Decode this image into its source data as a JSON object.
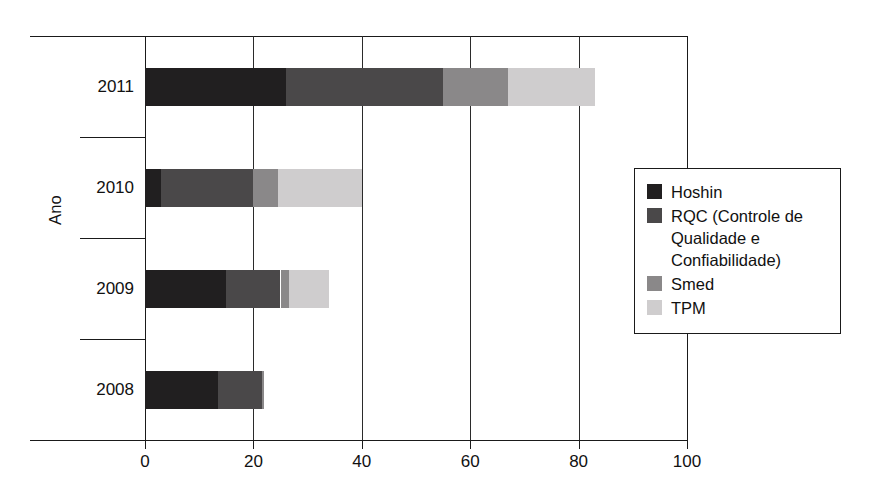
{
  "chart_data": {
    "type": "bar",
    "orientation": "horizontal",
    "stacked": true,
    "title": "",
    "xlabel": "",
    "ylabel": "Ano",
    "categories": [
      "2011",
      "2010",
      "2009",
      "2008"
    ],
    "xlim": [
      0,
      100
    ],
    "xticks": [
      0,
      20,
      40,
      60,
      80,
      100
    ],
    "xtick_labels": [
      "0",
      "20",
      "40",
      "60",
      "80",
      "100"
    ],
    "grid": "vertical",
    "legend_position": "right-middle",
    "series": [
      {
        "name": "Hoshin",
        "color": "#211f20",
        "values": [
          26,
          3,
          15,
          13.5
        ]
      },
      {
        "name": "RQC (Controle de Qualidade e Confiabilidade)",
        "color": "#4a4849",
        "values": [
          29,
          17,
          10,
          8
        ]
      },
      {
        "name": "Smed",
        "color": "#8a8889",
        "values": [
          12,
          4.5,
          1.5,
          0.5
        ]
      },
      {
        "name": "TPM",
        "color": "#cfcdce",
        "values": [
          16,
          15.5,
          7.5,
          0
        ]
      }
    ],
    "totals": [
      83,
      40,
      34,
      22
    ]
  },
  "axis": {
    "y_title": "Ano",
    "x_tick_labels": [
      "0",
      "20",
      "40",
      "60",
      "80",
      "100"
    ],
    "category_labels": [
      "2011",
      "2010",
      "2009",
      "2008"
    ]
  },
  "legend": {
    "items": [
      {
        "label": "Hoshin",
        "color": "#211f20"
      },
      {
        "label": "RQC (Controle de Qualidade e Confiabilidade)",
        "color": "#4a4849"
      },
      {
        "label": "Smed",
        "color": "#8a8889"
      },
      {
        "label": "TPM",
        "color": "#cfcdce"
      }
    ]
  },
  "colors": {
    "axis": "#1a1a1a",
    "background": "#ffffff",
    "text": "#111111"
  }
}
